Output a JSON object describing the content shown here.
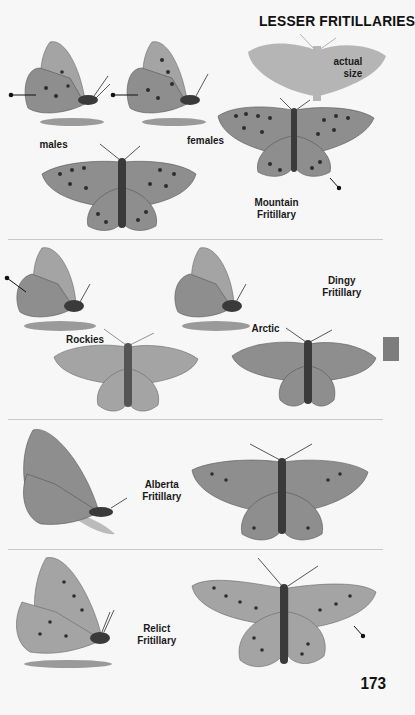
{
  "page": {
    "title": "LESSER FRITILLARIES",
    "page_number": "173",
    "section_tab_color": "#7d7d7d"
  },
  "sections": [
    {
      "species": "Mountain Fritillary",
      "species_line1": "Mountain",
      "species_line2": "Fritillary",
      "labels": {
        "males": "males",
        "females": "females",
        "actual_size_line1": "actual",
        "actual_size_line2": "size"
      }
    },
    {
      "species": "Dingy Fritillary",
      "species_line1": "Dingy",
      "species_line2": "Fritillary",
      "labels": {
        "rockies": "Rockies",
        "arctic": "Arctic"
      }
    },
    {
      "species": "Alberta Fritillary",
      "species_line1": "Alberta",
      "species_line2": "Fritillary"
    },
    {
      "species": "Relict Fritillary",
      "species_line1": "Relict",
      "species_line2": "Fritillary"
    }
  ]
}
